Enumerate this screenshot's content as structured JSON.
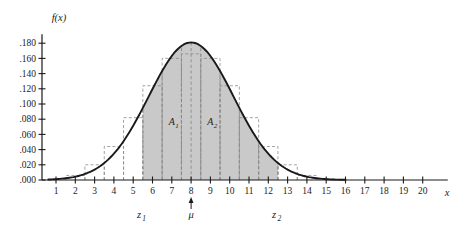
{
  "chart_data": {
    "type": "line",
    "title": "",
    "xlabel": "x",
    "ylabel": "f(x)",
    "xlim": [
      0,
      21.5
    ],
    "ylim": [
      0,
      0.192
    ],
    "grid": false,
    "legend": "none",
    "curve": {
      "name": "normal density f(x)",
      "distribution": "normal",
      "mean": 8.0,
      "sigma": 2.2,
      "peak_value": 0.181,
      "x": [
        0.5,
        1,
        1.5,
        2,
        2.5,
        3,
        3.5,
        4,
        4.5,
        5,
        5.5,
        6,
        6.5,
        7,
        7.5,
        8,
        8.5,
        9,
        9.5,
        10,
        10.5,
        11,
        11.5,
        12,
        12.5,
        13,
        13.5,
        14,
        14.5,
        15,
        15.5,
        16,
        16.5,
        17
      ],
      "y": [
        0.0003,
        0.0008,
        0.0019,
        0.0041,
        0.0082,
        0.0153,
        0.0265,
        0.0427,
        0.0642,
        0.0898,
        0.1168,
        0.1412,
        0.159,
        0.1671,
        0.1634,
        0.1813,
        0.1634,
        0.1671,
        0.159,
        0.1412,
        0.1168,
        0.0898,
        0.0642,
        0.0427,
        0.0265,
        0.0153,
        0.0082,
        0.0041,
        0.0019,
        0.0008,
        0.0003,
        0.0001,
        0.0,
        0.0
      ]
    },
    "histogram": {
      "note": "dashed step rectangles of unit width centered on integers",
      "bin_width": 1,
      "centers": [
        2,
        3,
        4,
        5,
        6,
        7,
        8,
        9,
        10,
        11,
        12,
        13,
        14
      ],
      "heights": [
        0.006,
        0.02,
        0.044,
        0.082,
        0.124,
        0.16,
        0.166,
        0.16,
        0.124,
        0.082,
        0.044,
        0.02,
        0.006
      ]
    },
    "shaded_region": {
      "label": "shaded probability area",
      "x_start": 5.5,
      "x_end": 12.5,
      "color": "#c9c9c9"
    },
    "x_ticks": [
      1,
      2,
      3,
      4,
      5,
      6,
      7,
      8,
      9,
      10,
      11,
      12,
      13,
      14,
      15,
      16,
      17,
      18,
      19,
      20
    ],
    "x_tick_labels": [
      "1",
      "2",
      "3",
      "4",
      "5",
      "6",
      "7",
      "8",
      "9",
      "10",
      "11",
      "12",
      "13",
      "14",
      "15",
      "16",
      "17",
      "18",
      "19",
      "20"
    ],
    "y_ticks": [
      0.0,
      0.02,
      0.04,
      0.06,
      0.08,
      0.1,
      0.12,
      0.14,
      0.16,
      0.18
    ],
    "y_tick_labels": [
      ".000",
      ".020",
      ".040",
      ".060",
      ".080",
      ".100",
      ".120",
      ".140",
      ".160",
      ".180"
    ],
    "annotations": [
      {
        "name": "area-1",
        "text": "A",
        "subscript": "1",
        "x": 7.0,
        "y": 0.072
      },
      {
        "name": "area-2",
        "text": "A",
        "subscript": "2",
        "x": 9.0,
        "y": 0.072
      },
      {
        "name": "z-lower",
        "text": "z",
        "subscript": "1",
        "x": 5.3,
        "y": -0.028
      },
      {
        "name": "mean-marker",
        "text": "μ",
        "subscript": "",
        "x": 8.0,
        "y": -0.028
      },
      {
        "name": "z-upper",
        "text": "z",
        "subscript": "2",
        "x": 12.3,
        "y": -0.028
      }
    ],
    "dashed_verticals": [
      5.5,
      6.5,
      7.5,
      8.0,
      8.5,
      9.5,
      10.5,
      11.5,
      12.5
    ]
  },
  "colors": {
    "curve": "#1a1a1a",
    "axis": "#1a1a1a",
    "shading": "#c9c9c9",
    "dashed": "#8a8a8a",
    "background": "#ffffff"
  }
}
